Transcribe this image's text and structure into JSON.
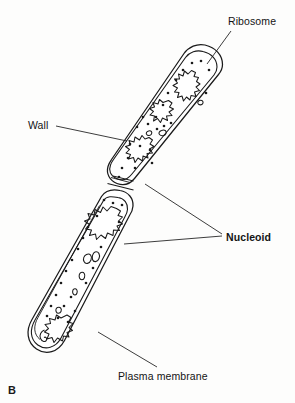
{
  "figure": {
    "panel_letter": "B",
    "background_color": "#fdfdfc",
    "line_color": "#1a1a1a"
  },
  "labels": {
    "ribosome": "Ribosome",
    "wall": "Wall",
    "nucleoid": "Nucleoid",
    "plasma_membrane": "Plasma membrane"
  },
  "diagram": {
    "cells": [
      {
        "name": "upper-daughter-cell",
        "wall_outline": "M 206.5 46.5 C 218.5 50.5 224.5 59.5 221.0 70.5 L 135.0 177.0 C 130.0 184.0 122.0 186.5 115.0 183.0 C 107.0 179.0 104.5 171.5 108.5 164.5 L 185.5 53.5 C 191.0 46.0 199.0 44.0 206.5 46.5 Z",
        "membrane_outline": "M 204.5 53.0 C 213.5 56.0 217.5 63.0 214.5 71.0 L 131.5 173.5 C 127.5 179.0 121.5 180.5 116.0 178.0 C 110.5 175.0 108.5 169.0 112.0 163.5 L 187.5 58.0 C 192.0 52.5 198.5 51.0 204.5 53.0 Z"
      },
      {
        "name": "lower-daughter-cell",
        "wall_outline": "M 124.5 193.0 C 132.5 196.5 135.0 204.5 130.5 212.0 L 63.5 340.0 C 57.5 351.0 47.0 353.5 38.0 348.0 C 29.0 342.0 27.5 331.5 33.5 321.5 L 104.5 196.5 C 109.0 189.5 117.5 189.5 124.5 193.0 Z",
        "membrane_outline": "M 121.5 199.5 C 128.0 202.5 129.5 208.5 126.0 214.5 L 60.0 337.5 C 55.0 346.5 46.5 348.5 39.5 344.0 C 32.5 339.0 31.5 330.5 36.5 322.0 L 106.5 202.5 C 110.5 196.0 116.0 196.5 121.5 199.5 Z"
      }
    ],
    "nucleoids": [
      {
        "name": "nucleoid-upper-distal",
        "cx": 186,
        "cy": 85
      },
      {
        "name": "nucleoid-upper-middle",
        "cx": 160,
        "cy": 110
      },
      {
        "name": "nucleoid-upper-proximal",
        "cx": 140,
        "cy": 160
      },
      {
        "name": "nucleoid-lower-proximal",
        "cx": 105,
        "cy": 232
      },
      {
        "name": "nucleoid-lower-distal",
        "cx": 58,
        "cy": 330
      }
    ],
    "ribosome_dots": [
      [
        188,
        63
      ],
      [
        196,
        60
      ],
      [
        178,
        72
      ],
      [
        205,
        68
      ],
      [
        172,
        82
      ],
      [
        165,
        95
      ],
      [
        183,
        99
      ],
      [
        155,
        108
      ],
      [
        162,
        120
      ],
      [
        152,
        128
      ],
      [
        146,
        118
      ],
      [
        143,
        140
      ],
      [
        135,
        133
      ],
      [
        155,
        145
      ],
      [
        128,
        150
      ],
      [
        138,
        152
      ],
      [
        120,
        158
      ],
      [
        130,
        165
      ],
      [
        118,
        170
      ],
      [
        148,
        160
      ],
      [
        111,
        179
      ],
      [
        110,
        222
      ],
      [
        98,
        228
      ],
      [
        90,
        238
      ],
      [
        100,
        245
      ],
      [
        84,
        248
      ],
      [
        78,
        258
      ],
      [
        88,
        262
      ],
      [
        70,
        268
      ],
      [
        80,
        275
      ],
      [
        64,
        282
      ],
      [
        74,
        288
      ],
      [
        58,
        292
      ],
      [
        68,
        300
      ],
      [
        52,
        302
      ],
      [
        62,
        310
      ],
      [
        46,
        312
      ],
      [
        56,
        318
      ],
      [
        70,
        245
      ],
      [
        92,
        255
      ]
    ],
    "leader_lines": [
      {
        "name": "leader-ribosome",
        "from": [
          229,
          31
        ],
        "to": [
          207,
          64
        ]
      },
      {
        "name": "leader-wall",
        "from": [
          55,
          126
        ],
        "to": [
          126,
          140
        ]
      },
      {
        "name": "leader-nucleoid-upper",
        "from": [
          222,
          234
        ],
        "to": [
          145,
          184
        ]
      },
      {
        "name": "leader-nucleoid-lower",
        "from": [
          222,
          236
        ],
        "to": [
          126,
          243
        ]
      },
      {
        "name": "leader-plasma-membrane",
        "from": [
          158,
          368
        ],
        "to": [
          98,
          333
        ]
      }
    ]
  }
}
